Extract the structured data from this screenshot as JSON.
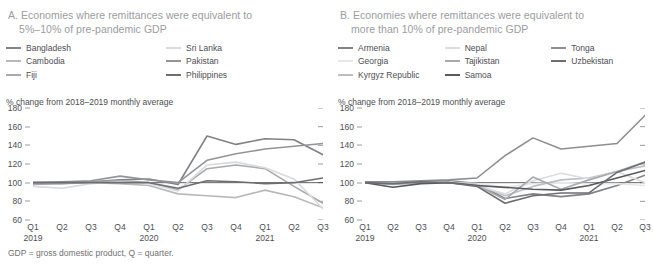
{
  "footnote": "GDP = gross domestic product, Q = quarter.",
  "axis_note": "% change from 2018–2019 monthly average",
  "panels": {
    "a": {
      "title_line1": "A. Economies where remittances were equivalent to",
      "title_line2": "5%–10% of pre-pandemic GDP",
      "legend": [
        {
          "label": "Bangladesh",
          "color": "#808285"
        },
        {
          "label": "Sri Lanka",
          "color": "#d9dadb"
        },
        {
          "label": "Cambodia",
          "color": "#b7b8ba"
        },
        {
          "label": "Pakistan",
          "color": "#929497"
        },
        {
          "label": "Fiji",
          "color": "#a7a9ac"
        },
        {
          "label": "Philippines",
          "color": "#6d6e71"
        }
      ]
    },
    "b": {
      "title_line1": "B. Economies where remittances were equivalent to",
      "title_line2": "more than 10% of pre-pandemic GDP",
      "legend": [
        {
          "label": "Armenia",
          "color": "#808285"
        },
        {
          "label": "Nepal",
          "color": "#dcdddd"
        },
        {
          "label": "Tonga",
          "color": "#8c8e90"
        },
        {
          "label": "Georgia",
          "color": "#e6e7e8"
        },
        {
          "label": "Tajikistan",
          "color": "#a7a9ac"
        },
        {
          "label": "Uzbekistan",
          "color": "#6d6e71"
        },
        {
          "label": "Kyrgyz Republic",
          "color": "#bcbec0"
        },
        {
          "label": "Samoa",
          "color": "#58595b"
        }
      ]
    }
  },
  "chart_data": [
    {
      "type": "line",
      "panel": "A",
      "title": "A. Economies where remittances were equivalent to 5%–10% of pre-pandemic GDP",
      "xlabel": "",
      "ylabel": "% change from 2018–2019 monthly average",
      "ylim": [
        60,
        180
      ],
      "yticks": [
        60,
        80,
        100,
        120,
        140,
        160,
        180
      ],
      "grid": false,
      "legend_position": "top",
      "x": [
        "Q1 2019",
        "Q2 2019",
        "Q3 2019",
        "Q4 2019",
        "Q1 2020",
        "Q2 2020",
        "Q3 2020",
        "Q4 2020",
        "Q1 2021",
        "Q2 2021",
        "Q3 2021"
      ],
      "categories": [
        "Q1",
        "Q2",
        "Q3",
        "Q4",
        "Q1",
        "Q2",
        "Q3",
        "Q4",
        "Q1",
        "Q2",
        "Q3"
      ],
      "years": [
        "2019",
        "",
        "",
        "",
        "2020",
        "",
        "",
        "",
        "2021",
        "",
        ""
      ],
      "series": [
        {
          "name": "Bangladesh",
          "color": "#808285",
          "values": [
            100,
            100,
            101,
            103,
            104,
            98,
            150,
            141,
            147,
            146,
            130
          ]
        },
        {
          "name": "Cambodia",
          "color": "#b7b8ba",
          "values": [
            100,
            99,
            100,
            99,
            97,
            88,
            86,
            84,
            92,
            85,
            73
          ]
        },
        {
          "name": "Fiji",
          "color": "#a7a9ac",
          "values": [
            98,
            99,
            101,
            102,
            100,
            92,
            115,
            119,
            115,
            96,
            78
          ]
        },
        {
          "name": "Sri Lanka",
          "color": "#d9dadb",
          "values": [
            96,
            94,
            99,
            101,
            99,
            91,
            119,
            122,
            116,
            104,
            72
          ]
        },
        {
          "name": "Pakistan",
          "color": "#929497",
          "values": [
            100,
            101,
            102,
            107,
            103,
            100,
            124,
            131,
            136,
            139,
            142
          ]
        },
        {
          "name": "Philippines",
          "color": "#6d6e71",
          "values": [
            100,
            100,
            100,
            100,
            100,
            94,
            102,
            101,
            99,
            100,
            105
          ]
        }
      ]
    },
    {
      "type": "line",
      "panel": "B",
      "title": "B. Economies where remittances were equivalent to more than 10% of pre-pandemic GDP",
      "xlabel": "",
      "ylabel": "% change from 2018–2019 monthly average",
      "ylim": [
        60,
        180
      ],
      "yticks": [
        60,
        80,
        100,
        120,
        140,
        160,
        180
      ],
      "grid": false,
      "legend_position": "top",
      "x": [
        "Q1 2019",
        "Q2 2019",
        "Q3 2019",
        "Q4 2019",
        "Q1 2020",
        "Q2 2020",
        "Q3 2020",
        "Q4 2020",
        "Q1 2021",
        "Q2 2021",
        "Q3 2021"
      ],
      "categories": [
        "Q1",
        "Q2",
        "Q3",
        "Q4",
        "Q1",
        "Q2",
        "Q3",
        "Q4",
        "Q1",
        "Q2",
        "Q3"
      ],
      "years": [
        "2019",
        "",
        "",
        "",
        "2020",
        "",
        "",
        "",
        "2021",
        "",
        ""
      ],
      "series": [
        {
          "name": "Armenia",
          "color": "#808285",
          "values": [
            100,
            99,
            101,
            102,
            99,
            83,
            88,
            85,
            88,
            97,
            108
          ]
        },
        {
          "name": "Georgia",
          "color": "#e6e7e8",
          "values": [
            100,
            100,
            100,
            100,
            99,
            95,
            99,
            100,
            99,
            99,
            97
          ]
        },
        {
          "name": "Kyrgyz Republic",
          "color": "#bcbec0",
          "values": [
            100,
            99,
            100,
            101,
            98,
            86,
            96,
            103,
            105,
            112,
            118
          ]
        },
        {
          "name": "Nepal",
          "color": "#dcdddd",
          "values": [
            100,
            99,
            101,
            101,
            97,
            88,
            102,
            110,
            104,
            112,
            100
          ]
        },
        {
          "name": "Tajikistan",
          "color": "#a7a9ac",
          "values": [
            100,
            98,
            100,
            100,
            97,
            82,
            106,
            93,
            103,
            112,
            122
          ]
        },
        {
          "name": "Samoa",
          "color": "#58595b",
          "values": [
            100,
            95,
            99,
            100,
            97,
            95,
            93,
            92,
            97,
            105,
            113
          ]
        },
        {
          "name": "Tonga",
          "color": "#8c8e90",
          "values": [
            101,
            101,
            102,
            103,
            105,
            129,
            148,
            136,
            139,
            142,
            172
          ]
        },
        {
          "name": "Uzbekistan",
          "color": "#6d6e71",
          "values": [
            100,
            99,
            101,
            100,
            96,
            78,
            86,
            89,
            89,
            111,
            122
          ]
        }
      ]
    }
  ]
}
